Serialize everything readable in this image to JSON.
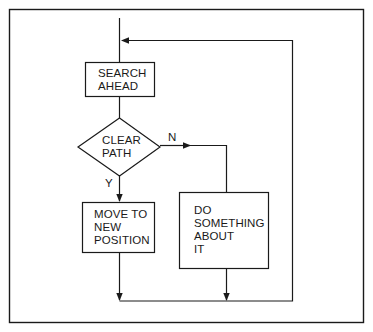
{
  "diagram": {
    "type": "flowchart",
    "stroke_color": "#1a1a1a",
    "background": "#ffffff",
    "nodes": [
      {
        "id": "search",
        "shape": "rectangle",
        "label": "SEARCH\nAHEAD"
      },
      {
        "id": "decision",
        "shape": "diamond",
        "label": "CLEAR\nPATH"
      },
      {
        "id": "move",
        "shape": "rectangle",
        "label": "MOVE TO\nNEW\nPOSITION"
      },
      {
        "id": "do_something",
        "shape": "rectangle",
        "label": "DO\nSOMETHING\nABOUT\nIT"
      }
    ],
    "edges": [
      {
        "from": "entry",
        "to": "search",
        "label": ""
      },
      {
        "from": "search",
        "to": "decision",
        "label": ""
      },
      {
        "from": "decision",
        "to": "move",
        "label": "Y"
      },
      {
        "from": "decision",
        "to": "do_something",
        "label": "N"
      },
      {
        "from": "move",
        "to": "loop_back",
        "label": ""
      },
      {
        "from": "do_something",
        "to": "loop_back",
        "label": ""
      },
      {
        "from": "loop_back",
        "to": "search",
        "label": ""
      }
    ],
    "branch_labels": {
      "yes": "Y",
      "no": "N"
    }
  }
}
